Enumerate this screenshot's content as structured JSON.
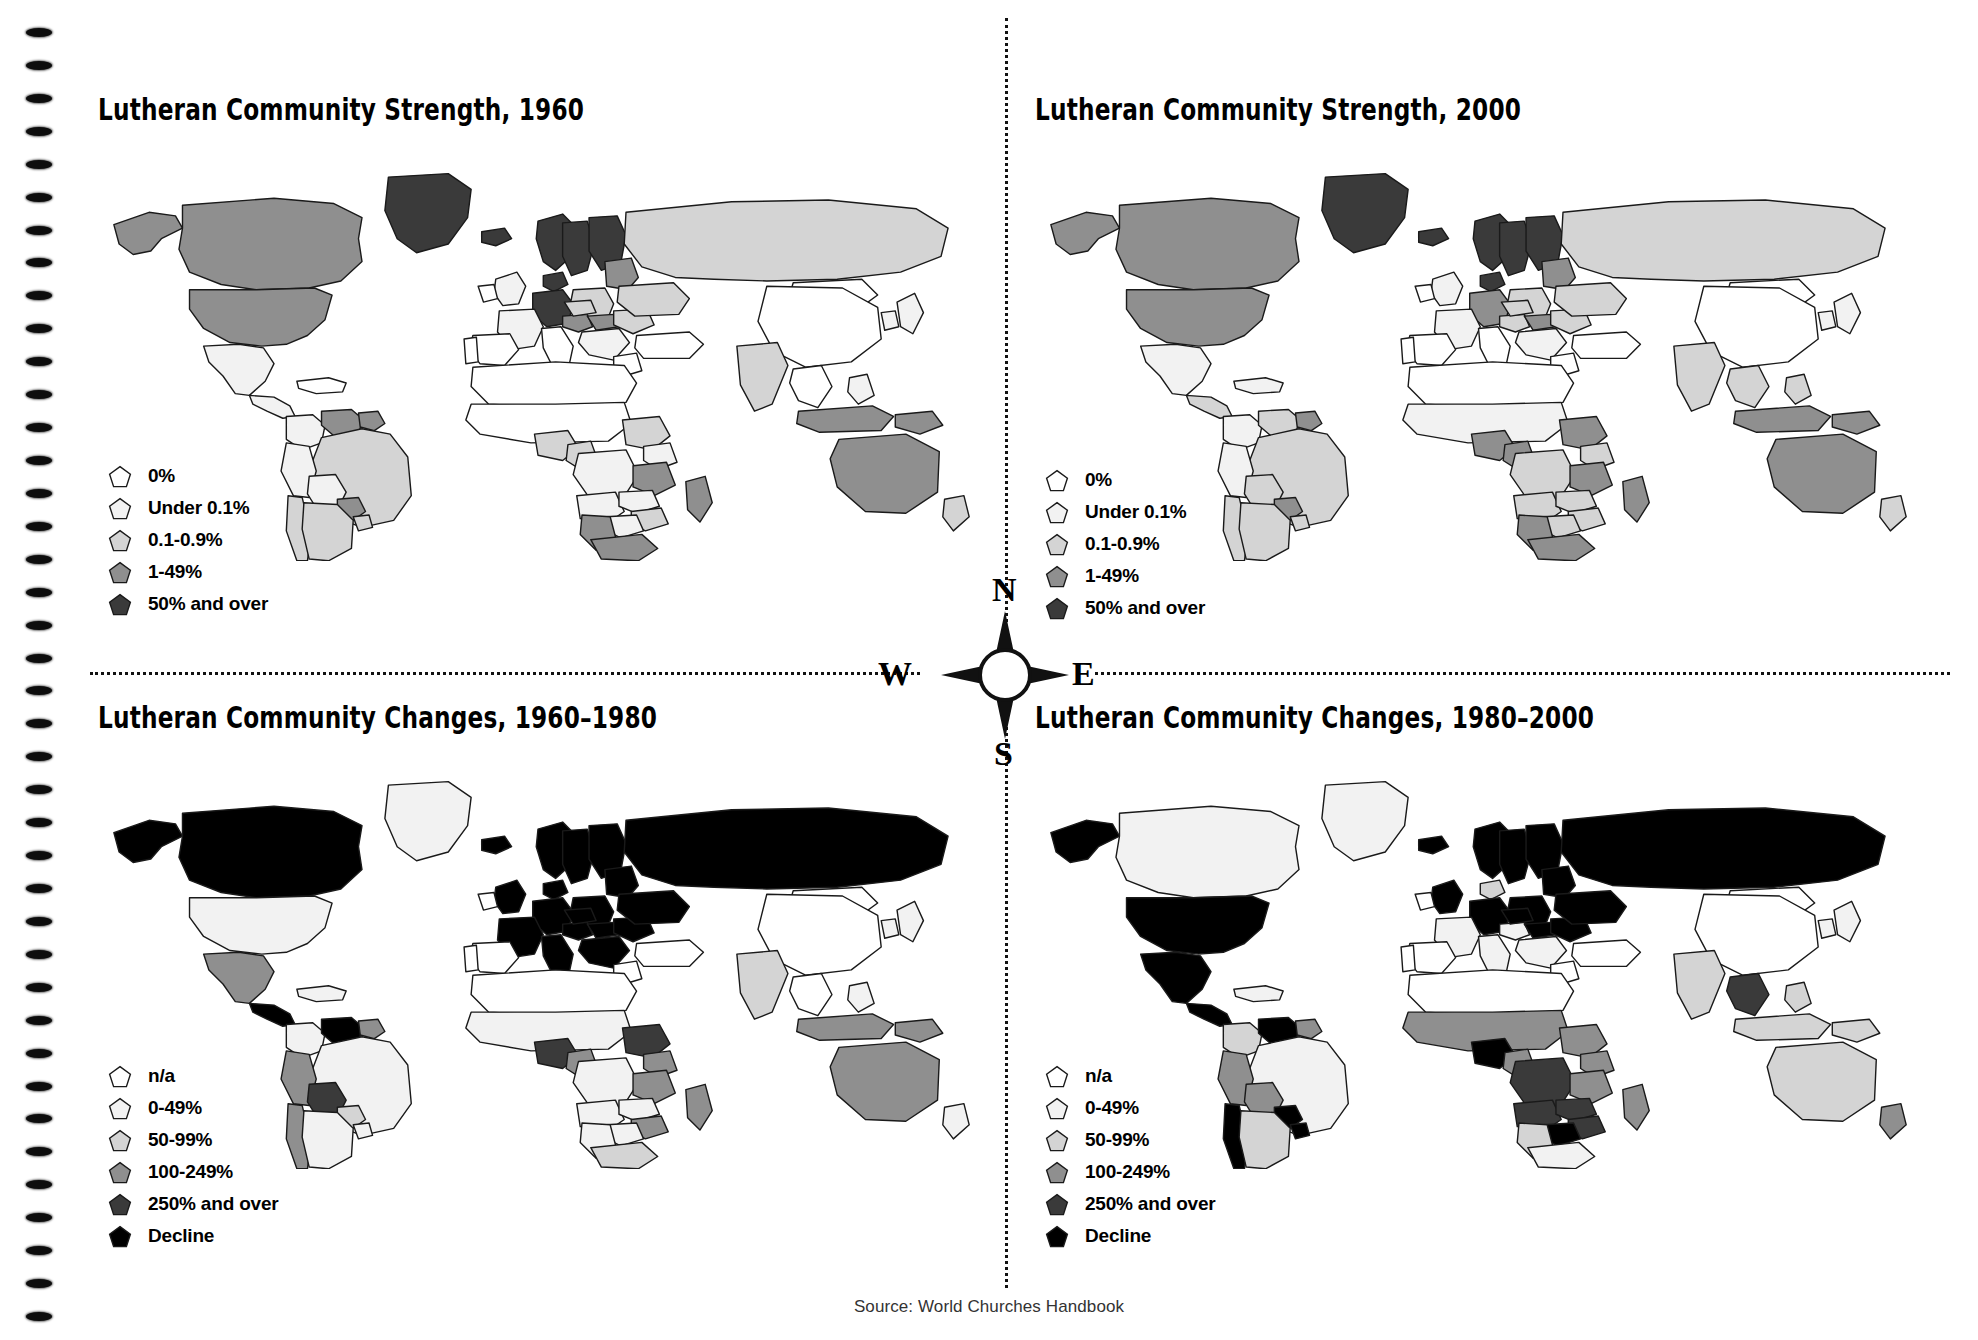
{
  "document": {
    "source_note": "Source: World Churches Handbook",
    "binding_holes": 40
  },
  "compass": {
    "n": "N",
    "e": "E",
    "s": "S",
    "w": "W"
  },
  "palette": {
    "level0": "#ffffff",
    "level1": "#f2f2f2",
    "level2": "#d4d4d4",
    "level3": "#8f8f8f",
    "level4": "#3a3a3a",
    "decline": "#000000",
    "stroke": "#1a1a1a"
  },
  "panels": [
    {
      "id": "strength-1960",
      "title": "Lutheran Community Strength, 1960",
      "legend_title": "",
      "legend": [
        {
          "label": "0%",
          "color": "#ffffff"
        },
        {
          "label": "Under 0.1%",
          "color": "#f2f2f2"
        },
        {
          "label": "0.1-0.9%",
          "color": "#d4d4d4"
        },
        {
          "label": "1-49%",
          "color": "#8f8f8f"
        },
        {
          "label": "50% and over",
          "color": "#3a3a3a"
        }
      ]
    },
    {
      "id": "strength-2000",
      "title": "Lutheran Community Strength,  2000",
      "legend_title": "",
      "legend": [
        {
          "label": "0%",
          "color": "#ffffff"
        },
        {
          "label": "Under 0.1%",
          "color": "#f2f2f2"
        },
        {
          "label": "0.1-0.9%",
          "color": "#d4d4d4"
        },
        {
          "label": "1-49%",
          "color": "#8f8f8f"
        },
        {
          "label": "50% and over",
          "color": "#3a3a3a"
        }
      ]
    },
    {
      "id": "changes-1960-1980",
      "title": "Lutheran Community Changes, 1960–1980",
      "legend_title": "",
      "legend": [
        {
          "label": "n/a",
          "color": "#ffffff"
        },
        {
          "label": "0-49%",
          "color": "#f2f2f2"
        },
        {
          "label": "50-99%",
          "color": "#d4d4d4"
        },
        {
          "label": "100-249%",
          "color": "#8f8f8f"
        },
        {
          "label": "250% and over",
          "color": "#3a3a3a"
        },
        {
          "label": "Decline",
          "color": "#000000"
        }
      ]
    },
    {
      "id": "changes-1980-2000",
      "title": "Lutheran Community Changes, 1980–2000",
      "legend_title": "",
      "legend": [
        {
          "label": "n/a",
          "color": "#ffffff"
        },
        {
          "label": "0-49%",
          "color": "#f2f2f2"
        },
        {
          "label": "50-99%",
          "color": "#d4d4d4"
        },
        {
          "label": "100-249%",
          "color": "#8f8f8f"
        },
        {
          "label": "250% and over",
          "color": "#3a3a3a"
        },
        {
          "label": "Decline",
          "color": "#000000"
        }
      ]
    }
  ],
  "map_data": {
    "type": "choropleth-world",
    "projection": "equirectangular-ish",
    "regions": {
      "strength-1960": {
        "alaska": "3",
        "canada": "3",
        "usa": "3",
        "greenland": "4",
        "mexico": "1",
        "centam": "1",
        "caribbean": "0",
        "colombia": "1",
        "venezuela": "3",
        "guyana": "3",
        "brazil": "2",
        "peru": "1",
        "bolivia": "1",
        "chile": "2",
        "argentina": "2",
        "paraguay": "3",
        "uruguay": "2",
        "iceland": "4",
        "uk": "1",
        "ireland": "0",
        "norway": "4",
        "sweden": "4",
        "finland": "4",
        "denmark": "4",
        "germany": "4",
        "poland": "2",
        "baltics": "3",
        "france": "1",
        "spain": "0",
        "portugal": "0",
        "italy": "0",
        "austria": "3",
        "czech": "2",
        "hungary": "3",
        "romania": "2",
        "balkans": "1",
        "greece": "0",
        "russia": "2",
        "ukraine": "2",
        "turkey": "0",
        "northafrica": "0",
        "sahel": "0",
        "nigeria": "2",
        "cameroon": "2",
        "ethiopia": "2",
        "tanzania": "3",
        "kenya": "1",
        "madagascar": "3",
        "southafrica": "3",
        "namibia": "3",
        "botswana": "1",
        "zimbabwe": "2",
        "zambia": "1",
        "angola": "1",
        "congo": "1",
        "india": "2",
        "china": "0",
        "mongolia": "0",
        "japan": "1",
        "korea": "1",
        "seasia": "0",
        "indonesia": "3",
        "png": "3",
        "australia": "3",
        "newzealand": "2",
        "philippines": "1"
      },
      "strength-2000": {
        "alaska": "3",
        "canada": "3",
        "usa": "3",
        "greenland": "4",
        "mexico": "1",
        "centam": "2",
        "caribbean": "1",
        "colombia": "1",
        "venezuela": "2",
        "guyana": "3",
        "brazil": "2",
        "peru": "1",
        "bolivia": "2",
        "chile": "2",
        "argentina": "2",
        "paraguay": "3",
        "uruguay": "2",
        "iceland": "4",
        "uk": "1",
        "ireland": "0",
        "norway": "4",
        "sweden": "4",
        "finland": "4",
        "denmark": "4",
        "germany": "3",
        "poland": "2",
        "baltics": "3",
        "france": "1",
        "spain": "0",
        "portugal": "0",
        "italy": "0",
        "austria": "2",
        "czech": "2",
        "hungary": "3",
        "romania": "2",
        "balkans": "1",
        "greece": "0",
        "russia": "2",
        "ukraine": "2",
        "turkey": "0",
        "northafrica": "0",
        "sahel": "1",
        "nigeria": "3",
        "cameroon": "3",
        "ethiopia": "3",
        "tanzania": "3",
        "kenya": "2",
        "madagascar": "3",
        "southafrica": "3",
        "namibia": "3",
        "botswana": "2",
        "zimbabwe": "2",
        "zambia": "2",
        "angola": "2",
        "congo": "2",
        "india": "2",
        "china": "0",
        "mongolia": "0",
        "japan": "1",
        "korea": "1",
        "seasia": "2",
        "indonesia": "3",
        "png": "3",
        "australia": "3",
        "newzealand": "2",
        "philippines": "2"
      },
      "changes-1960-1980": {
        "alaska": "5",
        "canada": "5",
        "usa": "1",
        "greenland": "1",
        "mexico": "3",
        "centam": "5",
        "caribbean": "1",
        "colombia": "1",
        "venezuela": "5",
        "guyana": "3",
        "brazil": "1",
        "peru": "3",
        "bolivia": "4",
        "chile": "3",
        "argentina": "1",
        "paraguay": "2",
        "uruguay": "1",
        "iceland": "5",
        "uk": "5",
        "ireland": "0",
        "norway": "5",
        "sweden": "5",
        "finland": "5",
        "denmark": "5",
        "germany": "5",
        "poland": "5",
        "baltics": "5",
        "france": "5",
        "spain": "0",
        "portugal": "0",
        "italy": "5",
        "austria": "5",
        "czech": "5",
        "hungary": "5",
        "romania": "5",
        "balkans": "5",
        "greece": "0",
        "russia": "5",
        "ukraine": "5",
        "turkey": "0",
        "northafrica": "0",
        "sahel": "1",
        "nigeria": "4",
        "cameroon": "3",
        "ethiopia": "4",
        "tanzania": "3",
        "kenya": "3",
        "madagascar": "3",
        "southafrica": "2",
        "namibia": "1",
        "botswana": "1",
        "zimbabwe": "3",
        "zambia": "1",
        "angola": "1",
        "congo": "1",
        "india": "2",
        "china": "0",
        "mongolia": "0",
        "japan": "1",
        "korea": "1",
        "seasia": "0",
        "indonesia": "3",
        "png": "3",
        "australia": "3",
        "newzealand": "1",
        "philippines": "1"
      },
      "changes-1980-2000": {
        "alaska": "5",
        "canada": "1",
        "usa": "5",
        "greenland": "1",
        "mexico": "5",
        "centam": "5",
        "caribbean": "1",
        "colombia": "2",
        "venezuela": "5",
        "guyana": "3",
        "brazil": "1",
        "peru": "3",
        "bolivia": "3",
        "chile": "5",
        "argentina": "2",
        "paraguay": "5",
        "uruguay": "5",
        "iceland": "5",
        "uk": "5",
        "ireland": "0",
        "norway": "5",
        "sweden": "5",
        "finland": "5",
        "denmark": "2",
        "germany": "5",
        "poland": "5",
        "baltics": "5",
        "france": "1",
        "spain": "0",
        "portugal": "0",
        "italy": "1",
        "austria": "1",
        "czech": "5",
        "hungary": "5",
        "romania": "5",
        "balkans": "1",
        "greece": "0",
        "russia": "5",
        "ukraine": "5",
        "turkey": "0",
        "northafrica": "0",
        "sahel": "3",
        "nigeria": "5",
        "cameroon": "3",
        "ethiopia": "3",
        "tanzania": "3",
        "kenya": "3",
        "madagascar": "3",
        "southafrica": "1",
        "namibia": "2",
        "botswana": "5",
        "zimbabwe": "4",
        "zambia": "4",
        "angola": "4",
        "congo": "4",
        "india": "2",
        "china": "0",
        "mongolia": "0",
        "japan": "1",
        "korea": "1",
        "seasia": "4",
        "indonesia": "2",
        "png": "2",
        "australia": "2",
        "newzealand": "3",
        "philippines": "2"
      }
    }
  }
}
